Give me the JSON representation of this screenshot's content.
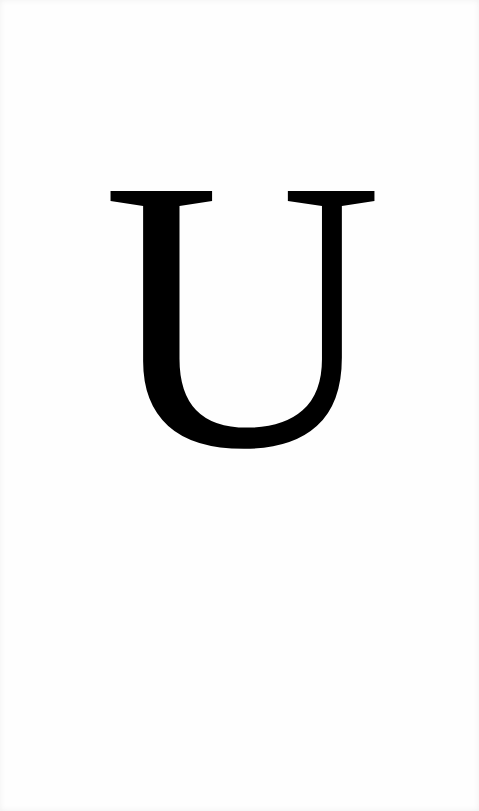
{
  "card": {
    "letter": "U",
    "letter_color": "#000000",
    "background_color": "#fefefe"
  }
}
